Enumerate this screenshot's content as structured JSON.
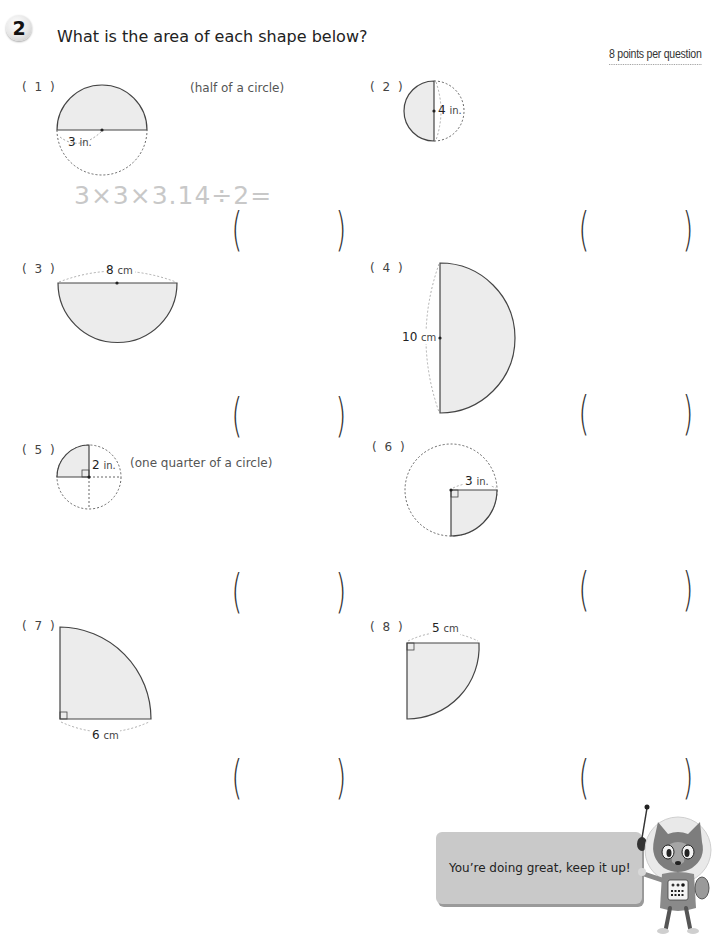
{
  "header": {
    "section_number": "2",
    "title": "What is the area of each shape below?",
    "points_note": "8 points per question"
  },
  "questions": [
    {
      "label": "( 1 )",
      "note": "(half of a circle)",
      "dimension_value": "3",
      "dimension_unit": "in.",
      "example_formula": "3×3×3.14÷2=",
      "answer": ""
    },
    {
      "label": "( 2 )",
      "dimension_value": "4",
      "dimension_unit": "in.",
      "answer": ""
    },
    {
      "label": "( 3 )",
      "dimension_value": "8",
      "dimension_unit": "cm",
      "answer": ""
    },
    {
      "label": "( 4 )",
      "dimension_value": "10",
      "dimension_unit": "cm",
      "answer": ""
    },
    {
      "label": "( 5 )",
      "note": "(one quarter of a circle)",
      "dimension_value": "2",
      "dimension_unit": "in.",
      "answer": ""
    },
    {
      "label": "( 6 )",
      "dimension_value": "3",
      "dimension_unit": "in.",
      "answer": ""
    },
    {
      "label": "( 7 )",
      "dimension_value": "6",
      "dimension_unit": "cm",
      "answer": ""
    },
    {
      "label": "( 8 )",
      "dimension_value": "5",
      "dimension_unit": "cm",
      "answer": ""
    }
  ],
  "answer_brackets": {
    "open": "(",
    "close": ")"
  },
  "encouragement": {
    "message": "You’re doing great, keep it up!",
    "character": "astronaut-cat-mascot"
  },
  "colors": {
    "shape_fill": "#ececec",
    "shape_stroke": "#444444",
    "dotted_stroke": "#666666",
    "formula_hint": "#c8c8c8",
    "bubble": "#c9c9c9"
  }
}
